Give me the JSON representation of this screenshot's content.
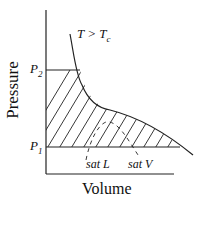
{
  "diagram": {
    "y_axis_label": "Pressure",
    "x_axis_label": "Volume",
    "curve_label_main": "T > T",
    "curve_label_sub": "c",
    "p2_main": "P",
    "p2_sub": "2",
    "p1_main": "P",
    "p1_sub": "1",
    "sat_liquid_label": "sat L",
    "sat_vapor_label": "sat V",
    "line_color": "#222222"
  }
}
